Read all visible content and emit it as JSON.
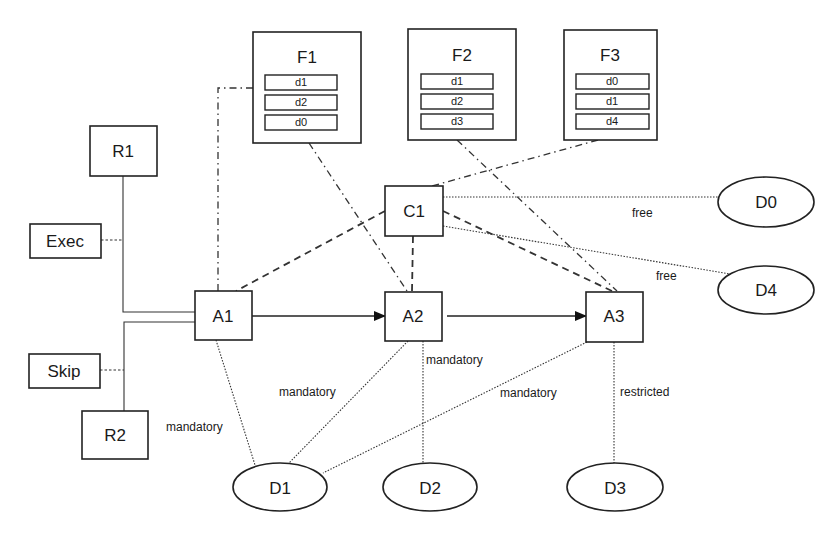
{
  "diagram": {
    "nodes": {
      "F1": {
        "label": "F1",
        "items": [
          "d1",
          "d2",
          "d0"
        ]
      },
      "F2": {
        "label": "F2",
        "items": [
          "d1",
          "d2",
          "d3"
        ]
      },
      "F3": {
        "label": "F3",
        "items": [
          "d0",
          "d1",
          "d4"
        ]
      },
      "R1": {
        "label": "R1"
      },
      "R2": {
        "label": "R2"
      },
      "Exec": {
        "label": "Exec"
      },
      "Skip": {
        "label": "Skip"
      },
      "A1": {
        "label": "A1"
      },
      "A2": {
        "label": "A2"
      },
      "A3": {
        "label": "A3"
      },
      "C1": {
        "label": "C1"
      },
      "D0": {
        "label": "D0"
      },
      "D1": {
        "label": "D1"
      },
      "D2": {
        "label": "D2"
      },
      "D3": {
        "label": "D3"
      },
      "D4": {
        "label": "D4"
      }
    },
    "edges": [
      {
        "from": "R1",
        "to": "A1",
        "style": "solid"
      },
      {
        "from": "R2",
        "to": "A1",
        "style": "solid"
      },
      {
        "from": "Exec",
        "to": "R1-A1",
        "style": "short-dashed"
      },
      {
        "from": "Skip",
        "to": "R2-A1",
        "style": "short-dashed"
      },
      {
        "from": "A1",
        "to": "A2",
        "style": "arrow"
      },
      {
        "from": "A2",
        "to": "A3",
        "style": "arrow"
      },
      {
        "from": "F1",
        "to": "A1",
        "style": "dash-dot"
      },
      {
        "from": "F1",
        "to": "A2",
        "style": "dash-dot"
      },
      {
        "from": "F2",
        "to": "A3",
        "style": "dash-dot"
      },
      {
        "from": "F3",
        "to": "C1",
        "style": "dash-dot"
      },
      {
        "from": "C1",
        "to": "A1",
        "style": "dashed"
      },
      {
        "from": "C1",
        "to": "A2",
        "style": "dashed"
      },
      {
        "from": "C1",
        "to": "A3",
        "style": "dashed"
      },
      {
        "from": "C1",
        "to": "D0",
        "style": "dotted",
        "label": "free"
      },
      {
        "from": "C1",
        "to": "D4",
        "style": "dotted",
        "label": "free"
      },
      {
        "from": "A1",
        "to": "D1",
        "style": "dotted",
        "label": "mandatory"
      },
      {
        "from": "A2",
        "to": "D1",
        "style": "dotted",
        "label": "mandatory"
      },
      {
        "from": "A2",
        "to": "D2",
        "style": "dotted",
        "label": "mandatory"
      },
      {
        "from": "A3",
        "to": "D1",
        "style": "dotted",
        "label": "mandatory"
      },
      {
        "from": "A3",
        "to": "D3",
        "style": "dotted",
        "label": "restricted"
      }
    ],
    "edge_labels": {
      "c1_d0": "free",
      "c1_d4": "free",
      "a1_d1": "mandatory",
      "a2_d1": "mandatory",
      "a2_d2": "mandatory",
      "a3_d1": "mandatory",
      "a3_d3": "restricted"
    }
  }
}
